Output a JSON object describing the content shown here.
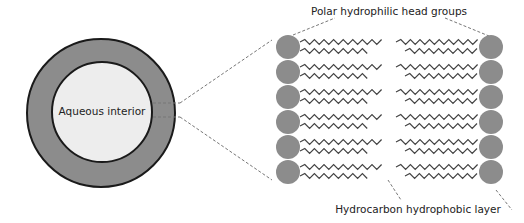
{
  "diagram": {
    "vesicle_label": "Aqueous interior",
    "top_label": "Polar hydrophilic head groups",
    "bottom_label": "Hydrocarbon hydrophobic layer",
    "head_rows": 6,
    "colors": {
      "membrane": "#8c8c8c",
      "interior": "#ededed",
      "outline": "#1a1a1a",
      "chain": "#444444",
      "dash": "#777777"
    }
  }
}
